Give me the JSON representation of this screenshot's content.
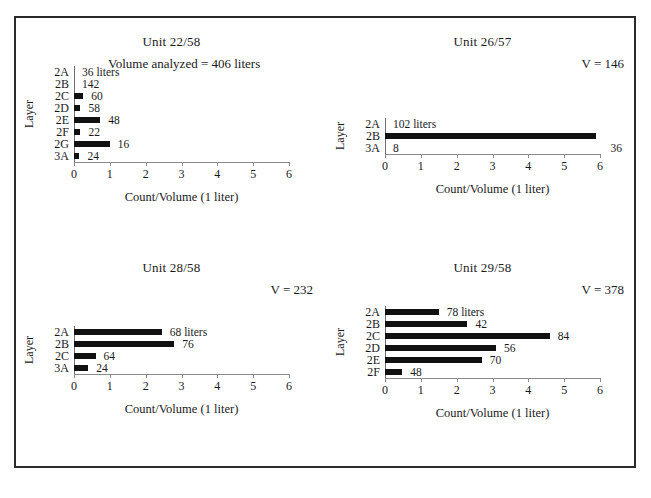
{
  "figure": {
    "axis_x_title": "Count/Volume (1 liter)",
    "axis_y_title": "Layer",
    "x_ticks": [
      "0",
      "1",
      "2",
      "3",
      "4",
      "5",
      "6"
    ],
    "bar_color": "#111111",
    "frame_color": "#2b2b2b"
  },
  "chart_data": [
    {
      "type": "bar",
      "orientation": "horizontal",
      "title": "Unit 22/58",
      "note": "Volume analyzed = 406 liters",
      "xlabel": "Count/Volume (1 liter)",
      "ylabel": "Layer",
      "xlim": [
        0,
        6
      ],
      "xticks": [
        0,
        1,
        2,
        3,
        4,
        5,
        6
      ],
      "grid": false,
      "categories": [
        "2A",
        "2B",
        "2C",
        "2D",
        "2E",
        "2F",
        "2G",
        "3A"
      ],
      "values": [
        0.0,
        0.0,
        0.26,
        0.18,
        0.73,
        0.18,
        1.0,
        0.15
      ],
      "point_labels": [
        "36 liters",
        "142",
        "60",
        "58",
        "48",
        "22",
        "16",
        "24"
      ]
    },
    {
      "type": "bar",
      "orientation": "horizontal",
      "title": "Unit 26/57",
      "note": "V = 146",
      "xlabel": "Count/Volume (1 liter)",
      "ylabel": "Layer",
      "xlim": [
        0,
        6
      ],
      "xticks": [
        0,
        1,
        2,
        3,
        4,
        5,
        6
      ],
      "grid": false,
      "categories": [
        "2A",
        "2B",
        "3A"
      ],
      "values": [
        0.0,
        5.9,
        0.0
      ],
      "point_labels": [
        "102 liters",
        "",
        "8"
      ],
      "right_edge_label": "36"
    },
    {
      "type": "bar",
      "orientation": "horizontal",
      "title": "Unit 28/58",
      "note": "V = 232",
      "xlabel": "Count/Volume (1 liter)",
      "ylabel": "Layer",
      "xlim": [
        0,
        6
      ],
      "xticks": [
        0,
        1,
        2,
        3,
        4,
        5,
        6
      ],
      "grid": false,
      "categories": [
        "2A",
        "2B",
        "2C",
        "3A"
      ],
      "values": [
        2.45,
        2.8,
        0.6,
        0.4
      ],
      "point_labels": [
        "68 liters",
        "76",
        "64",
        "24"
      ]
    },
    {
      "type": "bar",
      "orientation": "horizontal",
      "title": "Unit 29/58",
      "note": "V = 378",
      "xlabel": "Count/Volume (1 liter)",
      "ylabel": "Layer",
      "xlim": [
        0,
        6
      ],
      "xticks": [
        0,
        1,
        2,
        3,
        4,
        5,
        6
      ],
      "grid": false,
      "categories": [
        "2A",
        "2B",
        "2C",
        "2D",
        "2E",
        "2F"
      ],
      "values": [
        1.5,
        2.3,
        4.6,
        3.1,
        2.7,
        0.48
      ],
      "point_labels": [
        "78 liters",
        "42",
        "84",
        "56",
        "70",
        "48"
      ]
    }
  ]
}
